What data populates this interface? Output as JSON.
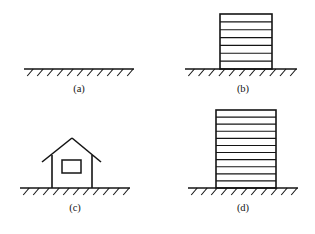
{
  "figure": {
    "width": 315,
    "height": 234,
    "background_color": "#ffffff",
    "ink_color": "#141414"
  },
  "panels": [
    {
      "id": "a",
      "label": "(a)",
      "label_x": 79,
      "label_y": 92,
      "structure": "none",
      "ground": {
        "x1": 24,
        "x2": 134,
        "y": 69,
        "hatch_count": 11,
        "hatch_dx": -6,
        "hatch_dy": 7
      }
    },
    {
      "id": "b",
      "label": "(b)",
      "label_x": 243,
      "label_y": 92,
      "structure": "building",
      "building": {
        "left": 220,
        "right": 272,
        "top": 14,
        "base": 69,
        "floor_count": 6,
        "stories_label": "6"
      },
      "ground": {
        "x1": 185,
        "x2": 297,
        "y": 69,
        "hatch_count": 11,
        "hatch_dx": -6,
        "hatch_dy": 7
      }
    },
    {
      "id": "c",
      "label": "(c)",
      "label_x": 75,
      "label_y": 211,
      "structure": "house",
      "house": {
        "wall_left": 52,
        "wall_right": 92,
        "wall_top": 155,
        "base": 188,
        "roof_peak_x": 72,
        "roof_peak_y": 138,
        "eave_left_x": 42,
        "eave_left_y": 162,
        "eave_right_x": 101,
        "eave_right_y": 162,
        "window_x": 62,
        "window_y": 160,
        "window_w": 19,
        "window_h": 13
      },
      "ground": {
        "x1": 20,
        "x2": 130,
        "y": 188,
        "hatch_count": 11,
        "hatch_dx": -6,
        "hatch_dy": 7
      }
    },
    {
      "id": "d",
      "label": "(d)",
      "label_x": 243,
      "label_y": 211,
      "structure": "building",
      "building": {
        "left": 216,
        "right": 276,
        "top": 110,
        "base": 188,
        "floor_count": 10,
        "stories_label": "10"
      },
      "ground": {
        "x1": 188,
        "x2": 298,
        "y": 188,
        "hatch_count": 11,
        "hatch_dx": -6,
        "hatch_dy": 7
      }
    }
  ]
}
